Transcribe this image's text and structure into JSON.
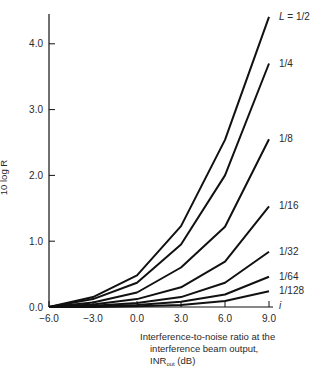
{
  "chart_data": {
    "type": "line",
    "title": "",
    "xlabel": "Interference-to-noise ratio at the interference beam output, INR_out (dB)",
    "xlabel_lines": [
      "Interference-to-noise ratio at the",
      "interference beam output,",
      "INR"
    ],
    "xlabel_sub": "out",
    "xlabel_unit": " (dB)",
    "ylabel": "10 log R",
    "x_axis_end_label": "i",
    "x": [
      -6.0,
      -3.0,
      0.0,
      3.0,
      6.0,
      9.0
    ],
    "x_tick_labels": [
      "−6.0",
      "−3.0",
      "0.0",
      "3.0",
      "6.0",
      "9.0"
    ],
    "y_ticks": [
      0.0,
      1.0,
      2.0,
      3.0,
      4.0
    ],
    "y_tick_labels": [
      "0.0",
      "1.0",
      "2.0",
      "3.0",
      "4.0"
    ],
    "xlim": [
      -6.0,
      9.0
    ],
    "ylim": [
      0.0,
      4.5
    ],
    "grid": false,
    "legend": "inline labels at line ends",
    "series": [
      {
        "name": "L = 1/2",
        "label": "L = 1/2",
        "values": [
          0.0,
          0.15,
          0.48,
          1.23,
          2.54,
          4.41
        ]
      },
      {
        "name": "1/4",
        "label": "1/4",
        "values": [
          0.0,
          0.12,
          0.37,
          0.95,
          2.0,
          3.7
        ]
      },
      {
        "name": "1/8",
        "label": "1/8",
        "values": [
          0.0,
          0.07,
          0.22,
          0.6,
          1.22,
          2.55
        ]
      },
      {
        "name": "1/16",
        "label": "1/16",
        "values": [
          0.0,
          0.04,
          0.12,
          0.3,
          0.69,
          1.53
        ]
      },
      {
        "name": "1/32",
        "label": "1/32",
        "values": [
          0.0,
          0.02,
          0.06,
          0.15,
          0.37,
          0.84
        ]
      },
      {
        "name": "1/64",
        "label": "1/64",
        "values": [
          0.0,
          0.01,
          0.03,
          0.08,
          0.19,
          0.46
        ]
      },
      {
        "name": "1/128",
        "label": "1/128",
        "values": [
          0.0,
          0.0,
          0.01,
          0.03,
          0.09,
          0.24
        ]
      }
    ],
    "line_color": "#111111"
  }
}
